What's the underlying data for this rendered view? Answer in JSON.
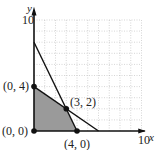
{
  "chart_data": {
    "type": "line",
    "title": "",
    "xlabel": "x",
    "ylabel": "y",
    "xlim": [
      0,
      10
    ],
    "ylim": [
      0,
      10
    ],
    "grid": true,
    "x_tick_label": "10",
    "y_tick_label": "10",
    "lines": [
      {
        "name": "line-1",
        "points": [
          [
            0,
            8
          ],
          [
            4,
            0
          ]
        ]
      },
      {
        "name": "line-2",
        "points": [
          [
            0,
            4
          ],
          [
            6,
            0
          ]
        ]
      }
    ],
    "feasible_region": [
      [
        0,
        0
      ],
      [
        0,
        4
      ],
      [
        3,
        2
      ],
      [
        4,
        0
      ]
    ],
    "points": [
      {
        "x": 0,
        "y": 0,
        "label": "(0, 0)"
      },
      {
        "x": 0,
        "y": 4,
        "label": "(0, 4)"
      },
      {
        "x": 3,
        "y": 2,
        "label": "(3, 2)"
      },
      {
        "x": 4,
        "y": 0,
        "label": "(4, 0)"
      }
    ],
    "colors": {
      "region": "#9a9a9a",
      "lines": "#111111",
      "grid": "#bbbbbb"
    }
  }
}
